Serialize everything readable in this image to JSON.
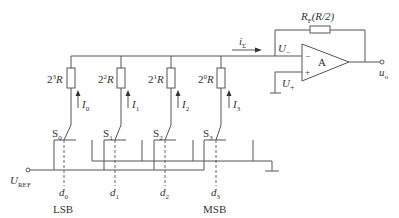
{
  "diagram": {
    "type": "inverted-ladder-dac-circuit",
    "resistors": [
      {
        "label_base": "2",
        "label_exp": "3",
        "label_suffix": "R",
        "current_label": "I",
        "current_sub": "0"
      },
      {
        "label_base": "2",
        "label_exp": "2",
        "label_suffix": "R",
        "current_label": "I",
        "current_sub": "1"
      },
      {
        "label_base": "2",
        "label_exp": "1",
        "label_suffix": "R",
        "current_label": "I",
        "current_sub": "2"
      },
      {
        "label_base": "2",
        "label_exp": "0",
        "label_suffix": "R",
        "current_label": "I",
        "current_sub": "3"
      }
    ],
    "switches": [
      {
        "label": "S",
        "sub": "0",
        "control": "d",
        "control_sub": "0"
      },
      {
        "label": "S",
        "sub": "1",
        "control": "d",
        "control_sub": "1"
      },
      {
        "label": "S",
        "sub": "2",
        "control": "d",
        "control_sub": "2"
      },
      {
        "label": "S",
        "sub": "3",
        "control": "d",
        "control_sub": "3"
      }
    ],
    "feedback_resistor": {
      "label": "R",
      "sub": "F",
      "value": "(R/2)"
    },
    "sum_current": {
      "label": "i",
      "sub": "Σ"
    },
    "opamp": {
      "label": "A",
      "minus_sign": "−",
      "plus_sign": "+",
      "inv_input": "U",
      "inv_sub": "−",
      "noninv_input": "U",
      "noninv_sub": "+"
    },
    "output": {
      "label": "u",
      "sub": "o"
    },
    "reference": {
      "label": "U",
      "sub": "REF"
    },
    "lsb_label": "LSB",
    "msb_label": "MSB"
  }
}
